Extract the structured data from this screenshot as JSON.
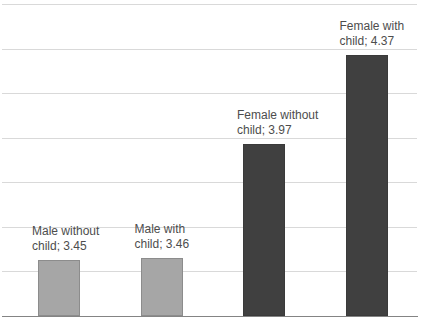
{
  "chart_data": {
    "type": "bar",
    "title": "",
    "xlabel": "",
    "ylabel": "",
    "categories": [
      "Male without child",
      "Male with child",
      "Female without child",
      "Female with child"
    ],
    "values": [
      3.45,
      3.46,
      3.97,
      4.37
    ],
    "labels": [
      {
        "line1": "Male without",
        "line2": "child; 3.45"
      },
      {
        "line1": "Male with",
        "line2": "child; 3.46"
      },
      {
        "line1": "Female without",
        "line2": "child; 3.97"
      },
      {
        "line1": "Female with",
        "line2": "child; 4.37"
      }
    ],
    "ylim": [
      3.2,
      4.6
    ],
    "grid_step": 0.2,
    "grid_on": true,
    "legend_position": "none",
    "bar_colors": [
      "#a6a6a6",
      "#a6a6a6",
      "#404040",
      "#404040"
    ],
    "bar_borders": [
      "#8c8c8c",
      "#8c8c8c",
      "#3a3a3a",
      "#3a3a3a"
    ],
    "colors": {
      "gridline": "#d9d9d9",
      "axis_line": "#848484",
      "label_text": "#4d4d4d",
      "background": "#ffffff"
    }
  }
}
